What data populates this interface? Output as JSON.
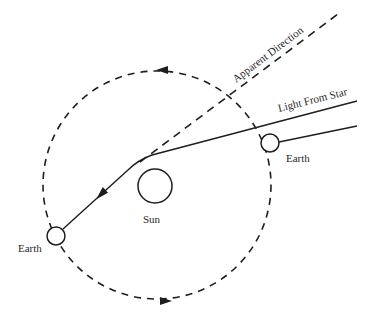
{
  "diagram": {
    "labels": {
      "apparent_direction": "Apparent Direction",
      "light_from_star": "Light From Star",
      "earth_right": "Earth",
      "earth_left": "Earth",
      "sun": "Sun"
    },
    "colors": {
      "stroke": "#1e1e1e",
      "background": "#ffffff"
    },
    "elements": {
      "orbit": {
        "type": "dashed-circle",
        "cx": 157,
        "cy": 185,
        "r": 114,
        "direction": "counter-clockwise"
      },
      "sun": {
        "cx": 155,
        "cy": 186,
        "r": 17
      },
      "earth_right": {
        "cx": 270,
        "cy": 143,
        "r": 9
      },
      "earth_left": {
        "cx": 56,
        "cy": 236,
        "r": 9
      },
      "light_ray": {
        "from": [
          357,
          101
        ],
        "bend": [
          140,
          162
        ],
        "to": [
          63,
          229
        ]
      },
      "parallel_ray": {
        "from": [
          357,
          126
        ],
        "to": [
          279,
          142
        ]
      },
      "apparent_direction_line": {
        "from": [
          140,
          162
        ],
        "to": [
          338,
          14
        ]
      }
    }
  }
}
